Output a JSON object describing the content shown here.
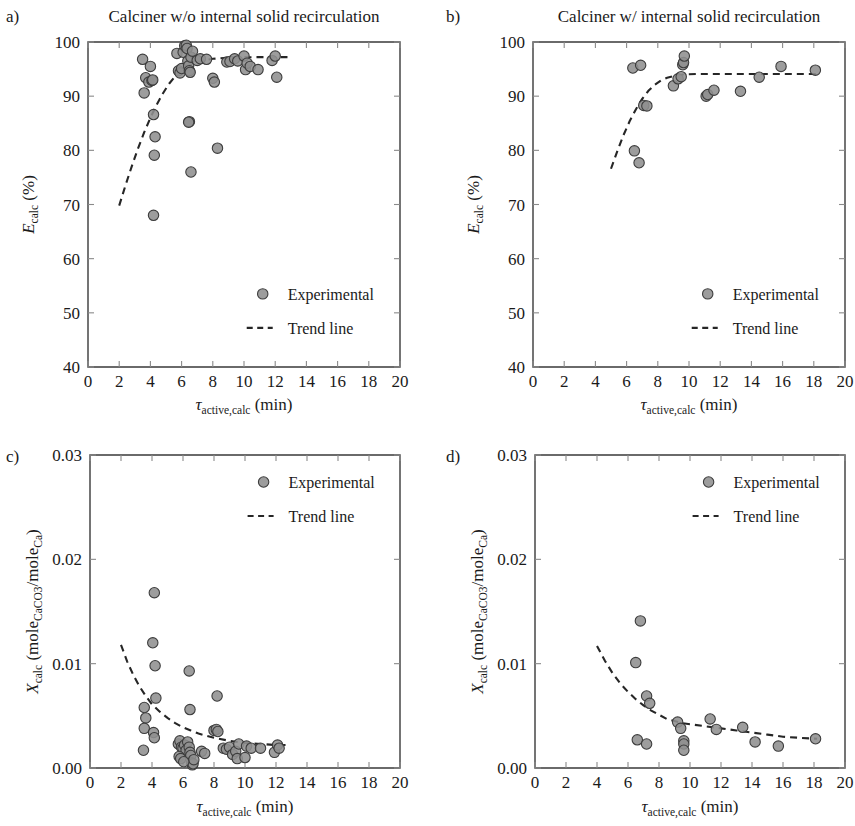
{
  "figure": {
    "background": "#ffffff",
    "marker_fill": "#8f8f8f",
    "marker_stroke": "#3d3d3d",
    "trend_color": "#262626",
    "axis_color": "#3a3a3a"
  },
  "labels": {
    "panel_a_letter": "a)",
    "panel_b_letter": "b)",
    "panel_c_letter": "c)",
    "panel_d_letter": "d)",
    "legend_experimental": "Experimental",
    "legend_trend": "Trend line",
    "x_axis_tau": "τ",
    "x_axis_sub": "active,calc",
    "x_axis_unit": "(min)",
    "y_axis_E": "E",
    "y_axis_E_sub": "calc",
    "y_axis_E_unit": "(%)",
    "y_axis_X": "X",
    "y_axis_X_sub": "calc",
    "y_axis_X_unit_open": "(mole",
    "y_axis_X_unit_sub1": "CaCO3",
    "y_axis_X_unit_mid": "/mole",
    "y_axis_X_unit_sub2": "Ca",
    "y_axis_X_unit_close": ")"
  },
  "chart_data": [
    {
      "id": "a",
      "type": "scatter",
      "title": "Calciner w/o internal solid recirculation",
      "panel_letter": "a)",
      "xlabel": "τactive,calc (min)",
      "ylabel": "Ecalc (%)",
      "xlim": [
        0,
        20
      ],
      "ylim": [
        40,
        100
      ],
      "xticks": [
        0,
        2,
        4,
        6,
        8,
        10,
        12,
        14,
        16,
        18,
        20
      ],
      "xtick_labels": [
        "0",
        "2",
        "4",
        "6",
        "8",
        "10",
        "12",
        "14",
        "16",
        "18",
        "20"
      ],
      "yticks": [
        40,
        50,
        60,
        70,
        80,
        90,
        100
      ],
      "ytick_labels": [
        "40",
        "50",
        "60",
        "70",
        "80",
        "90",
        "100"
      ],
      "grid": false,
      "legend_position": "lower-right",
      "series": [
        {
          "name": "Experimental",
          "marker": "circle",
          "points": [
            [
              3.5,
              96.8
            ],
            [
              3.6,
              90.6
            ],
            [
              3.7,
              93.4
            ],
            [
              3.9,
              92.6
            ],
            [
              4.0,
              95.5
            ],
            [
              4.1,
              92.9
            ],
            [
              4.15,
              93.0
            ],
            [
              4.2,
              86.6
            ],
            [
              4.3,
              82.5
            ],
            [
              4.25,
              79.1
            ],
            [
              4.2,
              68.0
            ],
            [
              5.7,
              97.9
            ],
            [
              5.8,
              94.7
            ],
            [
              5.9,
              94.3
            ],
            [
              6.0,
              95.1
            ],
            [
              6.1,
              98.1
            ],
            [
              6.2,
              99.3
            ],
            [
              6.3,
              99.4
            ],
            [
              6.35,
              98.8
            ],
            [
              6.4,
              96.5
            ],
            [
              6.45,
              95.6
            ],
            [
              6.5,
              94.7
            ],
            [
              6.55,
              94.4
            ],
            [
              6.6,
              97.2
            ],
            [
              6.7,
              98.3
            ],
            [
              6.5,
              85.3
            ],
            [
              6.45,
              85.2
            ],
            [
              6.6,
              76.0
            ],
            [
              7.0,
              96.6
            ],
            [
              7.2,
              96.9
            ],
            [
              7.6,
              96.8
            ],
            [
              8.0,
              93.3
            ],
            [
              8.1,
              92.6
            ],
            [
              8.3,
              80.4
            ],
            [
              8.9,
              96.3
            ],
            [
              9.1,
              96.4
            ],
            [
              9.4,
              96.9
            ],
            [
              9.6,
              96.5
            ],
            [
              10.0,
              97.4
            ],
            [
              10.1,
              94.9
            ],
            [
              10.2,
              96.1
            ],
            [
              10.4,
              95.5
            ],
            [
              10.9,
              94.9
            ],
            [
              11.8,
              96.6
            ],
            [
              12.0,
              97.4
            ],
            [
              12.1,
              93.5
            ]
          ]
        }
      ],
      "trend": {
        "name": "Trend line",
        "style": "dashed",
        "points": [
          [
            2.0,
            69.8
          ],
          [
            2.4,
            73.5
          ],
          [
            2.8,
            77.0
          ],
          [
            3.2,
            80.3
          ],
          [
            3.6,
            83.3
          ],
          [
            4.0,
            86.0
          ],
          [
            4.4,
            88.4
          ],
          [
            4.8,
            90.5
          ],
          [
            5.2,
            92.3
          ],
          [
            5.6,
            93.7
          ],
          [
            6.0,
            94.8
          ],
          [
            6.6,
            95.9
          ],
          [
            7.2,
            96.5
          ],
          [
            8.0,
            96.9
          ],
          [
            9.0,
            97.1
          ],
          [
            10.5,
            97.2
          ],
          [
            12.0,
            97.2
          ],
          [
            13.0,
            97.2
          ]
        ]
      }
    },
    {
      "id": "b",
      "type": "scatter",
      "title": "Calciner w/ internal solid recirculation",
      "panel_letter": "b)",
      "xlabel": "τactive,calc (min)",
      "ylabel": "Ecalc (%)",
      "xlim": [
        0,
        20
      ],
      "ylim": [
        40,
        100
      ],
      "xticks": [
        0,
        2,
        4,
        6,
        8,
        10,
        12,
        14,
        16,
        18,
        20
      ],
      "xtick_labels": [
        "0",
        "2",
        "4",
        "6",
        "8",
        "10",
        "12",
        "14",
        "16",
        "18",
        "20"
      ],
      "yticks": [
        40,
        50,
        60,
        70,
        80,
        90,
        100
      ],
      "ytick_labels": [
        "40",
        "50",
        "60",
        "70",
        "80",
        "90",
        "100"
      ],
      "grid": false,
      "legend_position": "lower-right",
      "series": [
        {
          "name": "Experimental",
          "marker": "circle",
          "points": [
            [
              6.4,
              95.2
            ],
            [
              6.9,
              95.7
            ],
            [
              6.5,
              79.9
            ],
            [
              6.8,
              77.7
            ],
            [
              7.1,
              88.3
            ],
            [
              7.3,
              88.2
            ],
            [
              9.0,
              91.9
            ],
            [
              9.3,
              93.2
            ],
            [
              9.5,
              93.6
            ],
            [
              9.6,
              95.8
            ],
            [
              9.65,
              96.2
            ],
            [
              9.7,
              97.4
            ],
            [
              11.1,
              90.0
            ],
            [
              11.2,
              90.3
            ],
            [
              11.6,
              91.1
            ],
            [
              13.3,
              90.9
            ],
            [
              14.5,
              93.5
            ],
            [
              15.9,
              95.5
            ],
            [
              18.1,
              94.8
            ]
          ]
        }
      ],
      "trend": {
        "name": "Trend line",
        "style": "dashed",
        "points": [
          [
            5.0,
            76.6
          ],
          [
            5.4,
            79.8
          ],
          [
            5.8,
            82.8
          ],
          [
            6.2,
            85.4
          ],
          [
            6.6,
            87.6
          ],
          [
            7.0,
            89.5
          ],
          [
            7.4,
            91.0
          ],
          [
            7.8,
            92.1
          ],
          [
            8.2,
            92.9
          ],
          [
            8.6,
            93.4
          ],
          [
            9.0,
            93.7
          ],
          [
            9.6,
            94.0
          ],
          [
            10.5,
            94.1
          ],
          [
            12.0,
            94.1
          ],
          [
            14.0,
            94.1
          ],
          [
            16.0,
            94.1
          ],
          [
            18.3,
            94.1
          ]
        ]
      }
    },
    {
      "id": "c",
      "type": "scatter",
      "title": "",
      "panel_letter": "c)",
      "xlabel": "τactive,calc (min)",
      "ylabel": "Xcalc (moleCaCO3/moleCa)",
      "xlim": [
        0,
        20
      ],
      "ylim": [
        0.0,
        0.03
      ],
      "xticks": [
        0,
        2,
        4,
        6,
        8,
        10,
        12,
        14,
        16,
        18,
        20
      ],
      "xtick_labels": [
        "0",
        "2",
        "4",
        "6",
        "8",
        "10",
        "12",
        "14",
        "16",
        "18",
        "20"
      ],
      "yticks": [
        0.0,
        0.01,
        0.02,
        0.03
      ],
      "ytick_labels": [
        "0.00",
        "0.01",
        "0.02",
        "0.03"
      ],
      "grid": false,
      "legend_position": "upper-right",
      "series": [
        {
          "name": "Experimental",
          "marker": "circle",
          "points": [
            [
              4.15,
              0.0168
            ],
            [
              4.05,
              0.012
            ],
            [
              4.2,
              0.0098
            ],
            [
              6.4,
              0.0093
            ],
            [
              4.25,
              0.0067
            ],
            [
              8.2,
              0.0069
            ],
            [
              3.5,
              0.0058
            ],
            [
              6.45,
              0.0056
            ],
            [
              3.6,
              0.0048
            ],
            [
              3.5,
              0.0038
            ],
            [
              4.1,
              0.0034
            ],
            [
              4.15,
              0.0029
            ],
            [
              8.0,
              0.0036
            ],
            [
              8.15,
              0.0037
            ],
            [
              8.25,
              0.0035
            ],
            [
              3.45,
              0.0017
            ],
            [
              5.7,
              0.0023
            ],
            [
              5.8,
              0.0026
            ],
            [
              5.9,
              0.002
            ],
            [
              6.0,
              0.0019
            ],
            [
              6.1,
              0.0022
            ],
            [
              6.2,
              0.0017
            ],
            [
              6.3,
              0.0025
            ],
            [
              6.4,
              0.002
            ],
            [
              6.45,
              0.0015
            ],
            [
              6.5,
              0.0012
            ],
            [
              6.55,
              0.0005
            ],
            [
              6.6,
              0.0003
            ],
            [
              6.65,
              0.0004
            ],
            [
              6.7,
              0.0008
            ],
            [
              5.75,
              0.0011
            ],
            [
              5.85,
              0.0009
            ],
            [
              6.05,
              0.0006
            ],
            [
              7.2,
              0.0016
            ],
            [
              7.4,
              0.0014
            ],
            [
              8.6,
              0.0019
            ],
            [
              8.8,
              0.0018
            ],
            [
              9.0,
              0.002
            ],
            [
              9.2,
              0.0013
            ],
            [
              9.4,
              0.0016
            ],
            [
              9.5,
              0.0009
            ],
            [
              9.6,
              0.0023
            ],
            [
              10.0,
              0.001
            ],
            [
              10.1,
              0.0021
            ],
            [
              10.4,
              0.0019
            ],
            [
              11.0,
              0.0019
            ],
            [
              11.9,
              0.0015
            ],
            [
              12.1,
              0.0022
            ],
            [
              12.2,
              0.0019
            ]
          ]
        }
      ],
      "trend": {
        "name": "Trend line",
        "style": "dashed",
        "points": [
          [
            2.0,
            0.0118
          ],
          [
            2.4,
            0.0102
          ],
          [
            2.8,
            0.0089
          ],
          [
            3.2,
            0.0078
          ],
          [
            3.6,
            0.0069
          ],
          [
            4.0,
            0.0061
          ],
          [
            4.5,
            0.0054
          ],
          [
            5.0,
            0.0048
          ],
          [
            5.5,
            0.0043
          ],
          [
            6.0,
            0.0039
          ],
          [
            6.5,
            0.0036
          ],
          [
            7.0,
            0.0033
          ],
          [
            7.5,
            0.0031
          ],
          [
            8.0,
            0.0029
          ],
          [
            9.0,
            0.0026
          ],
          [
            10.0,
            0.0024
          ],
          [
            11.0,
            0.0023
          ],
          [
            12.0,
            0.0022
          ],
          [
            12.9,
            0.0022
          ]
        ]
      }
    },
    {
      "id": "d",
      "type": "scatter",
      "title": "",
      "panel_letter": "d)",
      "xlabel": "τactive,calc (min)",
      "ylabel": "Xcalc (moleCaCO3/moleCa)",
      "xlim": [
        0,
        20
      ],
      "ylim": [
        0.0,
        0.03
      ],
      "xticks": [
        0,
        2,
        4,
        6,
        8,
        10,
        12,
        14,
        16,
        18,
        20
      ],
      "xtick_labels": [
        "0",
        "2",
        "4",
        "6",
        "8",
        "10",
        "12",
        "14",
        "16",
        "18",
        "20"
      ],
      "yticks": [
        0.0,
        0.01,
        0.02,
        0.03
      ],
      "ytick_labels": [
        "0.00",
        "0.01",
        "0.02",
        "0.03"
      ],
      "grid": false,
      "legend_position": "upper-right",
      "series": [
        {
          "name": "Experimental",
          "marker": "circle",
          "points": [
            [
              6.8,
              0.0141
            ],
            [
              6.5,
              0.0101
            ],
            [
              7.2,
              0.0069
            ],
            [
              7.4,
              0.0062
            ],
            [
              6.6,
              0.0027
            ],
            [
              7.2,
              0.0023
            ],
            [
              9.2,
              0.0044
            ],
            [
              9.4,
              0.0038
            ],
            [
              9.6,
              0.0026
            ],
            [
              9.6,
              0.0023
            ],
            [
              9.6,
              0.0017
            ],
            [
              11.3,
              0.0047
            ],
            [
              11.7,
              0.0037
            ],
            [
              13.4,
              0.0039
            ],
            [
              14.2,
              0.0025
            ],
            [
              15.7,
              0.0021
            ],
            [
              18.1,
              0.0028
            ]
          ]
        }
      ],
      "trend": {
        "name": "Trend line",
        "style": "dashed",
        "points": [
          [
            4.0,
            0.0117
          ],
          [
            4.5,
            0.0103
          ],
          [
            5.0,
            0.0091
          ],
          [
            5.5,
            0.0081
          ],
          [
            6.0,
            0.0073
          ],
          [
            6.5,
            0.0066
          ],
          [
            7.0,
            0.006
          ],
          [
            7.5,
            0.0055
          ],
          [
            8.0,
            0.0051
          ],
          [
            8.5,
            0.0047
          ],
          [
            9.0,
            0.0045
          ],
          [
            9.5,
            0.0043
          ],
          [
            10.0,
            0.0042
          ],
          [
            11.0,
            0.004
          ],
          [
            12.0,
            0.0038
          ],
          [
            13.0,
            0.0036
          ],
          [
            14.0,
            0.0034
          ],
          [
            15.0,
            0.0032
          ],
          [
            16.0,
            0.003
          ],
          [
            17.0,
            0.0029
          ],
          [
            18.2,
            0.0028
          ]
        ]
      }
    }
  ]
}
